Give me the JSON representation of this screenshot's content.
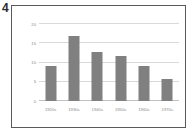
{
  "figure": {
    "number": "4"
  },
  "chart_data": {
    "type": "bar",
    "title": "",
    "xlabel": "",
    "ylabel": "",
    "categories": [
      "1920s",
      "1930s",
      "1940s",
      "1950s",
      "1960s",
      "1970s"
    ],
    "values": [
      9.0,
      16.8,
      12.8,
      11.8,
      9.0,
      5.8
    ],
    "ylim": [
      0,
      20
    ],
    "yticks": [
      0,
      5,
      10,
      15,
      20
    ],
    "ytick_labels": [
      "0",
      "5",
      "10",
      "15",
      "20"
    ],
    "grid": true,
    "grid_axis": "y",
    "legend": false,
    "bar_color": "#808080",
    "gridline_color": "#d9d9d9",
    "tick_label_color": "#8a8a8a",
    "frame_color": "#5a5a5a",
    "background_color": "#ffffff"
  }
}
